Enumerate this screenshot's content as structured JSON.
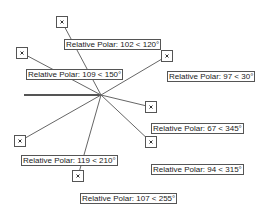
{
  "diagram": {
    "center": {
      "x": 101,
      "y": 95
    },
    "base_line": {
      "x1": 24,
      "y1": 95,
      "x2": 101,
      "y2": 95,
      "color": "#555555",
      "width": 2
    },
    "spoke_color": "#666666",
    "marker_border_color": "#555555",
    "points": [
      {
        "distance": 102,
        "angle": 120,
        "marker": {
          "x": 62,
          "y": 22
        },
        "label": {
          "text": "Relative Polar: 102 < 120°",
          "left": 64,
          "top": 39
        }
      },
      {
        "distance": 109,
        "angle": 150,
        "marker": {
          "x": 22,
          "y": 53
        },
        "label": {
          "text": "Relative Polar: 109 < 150°",
          "left": 26,
          "top": 69
        }
      },
      {
        "distance": 97,
        "angle": 30,
        "marker": {
          "x": 167,
          "y": 56
        },
        "label": {
          "text": "Relative Polar: 97 < 30°",
          "left": 167,
          "top": 71
        }
      },
      {
        "distance": 67,
        "angle": 345,
        "marker": {
          "x": 151,
          "y": 107
        },
        "label": {
          "text": "Relative Polar: 67 < 345°",
          "left": 151,
          "top": 123
        }
      },
      {
        "distance": 94,
        "angle": 315,
        "marker": {
          "x": 151,
          "y": 142
        },
        "label": {
          "text": "Relative Polar: 94 < 315°",
          "left": 151,
          "top": 164
        }
      },
      {
        "distance": 119,
        "angle": 210,
        "marker": {
          "x": 20,
          "y": 141
        },
        "label": {
          "text": "Relative Polar: 119 < 210°",
          "left": 21,
          "top": 155
        }
      },
      {
        "distance": 107,
        "angle": 255,
        "marker": {
          "x": 78,
          "y": 176
        },
        "label": {
          "text": "Relative Polar: 107 < 255°",
          "left": 80,
          "top": 193
        }
      }
    ]
  }
}
